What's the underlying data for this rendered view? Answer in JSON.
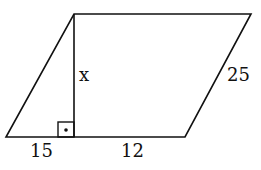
{
  "diagram": {
    "type": "parallelogram",
    "labels": {
      "height": "x",
      "side": "25",
      "base_left": "15",
      "base_right": "12"
    },
    "right_angle_marker": true,
    "colors": {
      "stroke": "#111111",
      "background": "#ffffff"
    }
  }
}
